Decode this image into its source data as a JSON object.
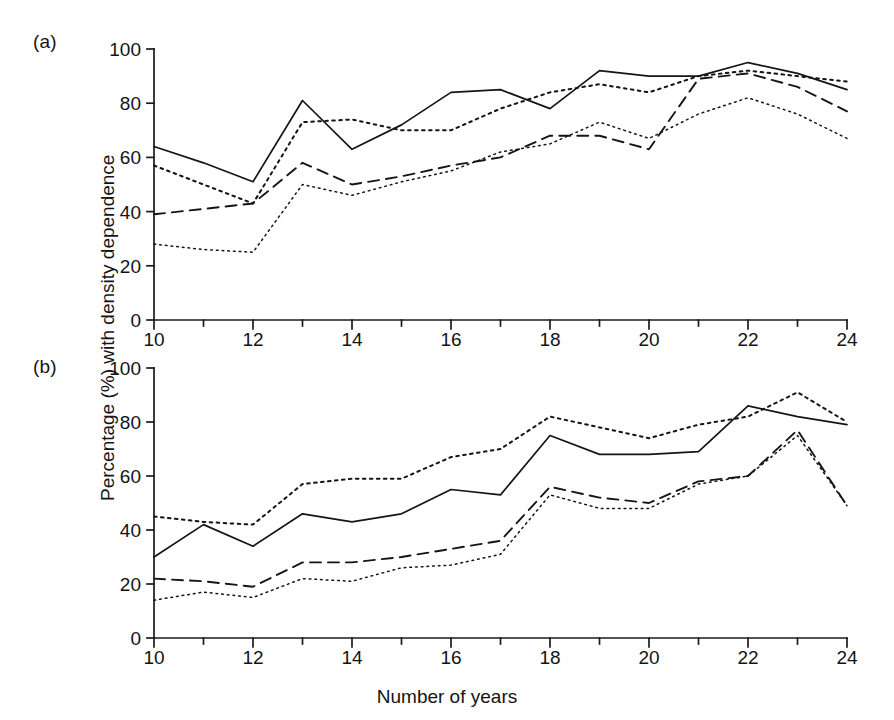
{
  "figure": {
    "xlabel": "Number of years",
    "ylabel": "Percentage (%) with density dependence",
    "panel_a_tag": "(a)",
    "panel_b_tag": "(b)"
  },
  "axis": {
    "x_ticks": [
      "10",
      "12",
      "14",
      "16",
      "18",
      "20",
      "22",
      "24"
    ],
    "y_ticks": [
      "0",
      "20",
      "40",
      "60",
      "80",
      "100"
    ]
  },
  "chart_data": [
    {
      "type": "line",
      "panel": "(a)",
      "title": "",
      "xlabel": "Number of years",
      "ylabel": "Percentage (%) with density dependence",
      "xlim": [
        10,
        24
      ],
      "ylim": [
        0,
        100
      ],
      "xticks": [
        10,
        12,
        14,
        16,
        18,
        20,
        22,
        24
      ],
      "yticks": [
        0,
        20,
        40,
        60,
        80,
        100
      ],
      "grid": false,
      "legend": "none",
      "x": [
        10,
        11,
        12,
        13,
        14,
        15,
        16,
        17,
        18,
        19,
        20,
        21,
        22,
        23,
        24
      ],
      "series": [
        {
          "name": "solid",
          "style": "solid",
          "values": [
            64,
            58,
            51,
            81,
            63,
            72,
            84,
            85,
            78,
            92,
            90,
            90,
            95,
            91,
            85
          ]
        },
        {
          "name": "dotted-dense",
          "style": "dotted-dense",
          "values": [
            57,
            50,
            43,
            73,
            74,
            70,
            70,
            78,
            84,
            87,
            84,
            90,
            92,
            90,
            88
          ]
        },
        {
          "name": "dashed",
          "style": "dashed",
          "values": [
            39,
            41,
            43,
            58,
            50,
            53,
            57,
            60,
            68,
            68,
            63,
            89,
            91,
            86,
            77
          ]
        },
        {
          "name": "dotted-fine",
          "style": "dotted-fine",
          "values": [
            28,
            26,
            25,
            50,
            46,
            51,
            55,
            62,
            65,
            73,
            67,
            76,
            82,
            76,
            67
          ]
        }
      ]
    },
    {
      "type": "line",
      "panel": "(b)",
      "title": "",
      "xlabel": "Number of years",
      "ylabel": "Percentage (%) with density dependence",
      "xlim": [
        10,
        24
      ],
      "ylim": [
        0,
        100
      ],
      "xticks": [
        10,
        12,
        14,
        16,
        18,
        20,
        22,
        24
      ],
      "yticks": [
        0,
        20,
        40,
        60,
        80,
        100
      ],
      "grid": false,
      "legend": "none",
      "x": [
        10,
        11,
        12,
        13,
        14,
        15,
        16,
        17,
        18,
        19,
        20,
        21,
        22,
        23,
        24
      ],
      "series": [
        {
          "name": "dotted-dense",
          "style": "dotted-dense",
          "values": [
            45,
            43,
            42,
            57,
            59,
            59,
            67,
            70,
            82,
            78,
            74,
            79,
            82,
            91,
            80
          ]
        },
        {
          "name": "solid",
          "style": "solid",
          "values": [
            30,
            42,
            34,
            46,
            43,
            46,
            55,
            53,
            75,
            68,
            68,
            69,
            86,
            82,
            79
          ]
        },
        {
          "name": "dashed",
          "style": "dashed",
          "values": [
            22,
            21,
            19,
            28,
            28,
            30,
            33,
            36,
            56,
            52,
            50,
            58,
            60,
            77,
            49
          ]
        },
        {
          "name": "dotted-fine",
          "style": "dotted-fine",
          "values": [
            14,
            17,
            15,
            22,
            21,
            26,
            27,
            31,
            53,
            48,
            48,
            57,
            60,
            75,
            49
          ]
        }
      ]
    }
  ]
}
